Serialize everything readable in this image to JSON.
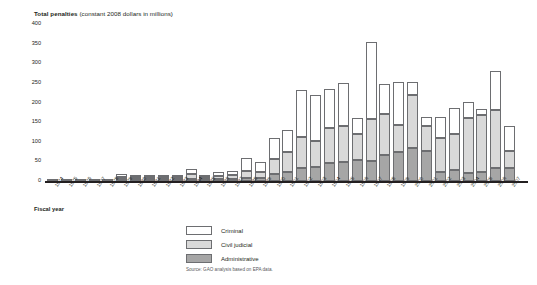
{
  "chart_data": {
    "type": "bar",
    "stacked": true,
    "title": "Total penalties (constant 2008 dollars in millions)",
    "title_bold_part": "Total penalties",
    "title_light_part": "(constant 2008 dollars in millions)",
    "xlabel": "Fiscal year",
    "ylabel": "",
    "ylim": [
      0,
      400
    ],
    "yticks": [
      0,
      50,
      100,
      150,
      200,
      250,
      300,
      350,
      400
    ],
    "ytick_labels": [
      "0",
      "50",
      "100",
      "150",
      "200",
      "250",
      "300",
      "350",
      "400"
    ],
    "grid": false,
    "legend_position": "bottom-center",
    "categories": [
      "1974",
      "1975",
      "1976",
      "1977",
      "1978",
      "1979",
      "1980",
      "1981",
      "1982",
      "1983",
      "1984",
      "1985",
      "1986",
      "1987",
      "1988",
      "1989",
      "1990",
      "1991",
      "1992",
      "1993",
      "1994",
      "1995",
      "1996",
      "1997",
      "1998",
      "1999",
      "2000",
      "2001",
      "2002",
      "2003",
      "2004",
      "2005",
      "2006",
      "2007"
    ],
    "series": [
      {
        "name": "Administrative",
        "color": "#a6a6a6",
        "values": [
          0,
          0,
          0,
          0,
          0,
          2,
          2,
          1,
          1,
          2,
          6,
          3,
          3,
          4,
          8,
          9,
          18,
          24,
          34,
          36,
          48,
          49,
          54,
          52,
          67,
          75,
          84,
          78,
          25,
          28,
          22,
          25,
          33,
          35
        ]
      },
      {
        "name": "Civil judicial",
        "color": "#d9d9d9",
        "values": [
          0,
          0,
          0,
          0,
          0,
          6,
          5,
          2,
          2,
          3,
          14,
          6,
          8,
          10,
          18,
          14,
          40,
          50,
          78,
          68,
          88,
          93,
          68,
          106,
          106,
          68,
          135,
          63,
          85,
          92,
          140,
          145,
          150,
          42
        ]
      },
      {
        "name": "Criminal",
        "color": "#ffffff",
        "values": [
          1,
          1,
          1,
          1,
          1,
          8,
          6,
          2,
          2,
          3,
          12,
          6,
          10,
          12,
          33,
          27,
          52,
          56,
          120,
          116,
          100,
          110,
          40,
          198,
          75,
          110,
          35,
          22,
          55,
          66,
          40,
          15,
          98,
          64
        ]
      }
    ],
    "totals": [
      1,
      1,
      1,
      1,
      1,
      16,
      13,
      5,
      5,
      8,
      32,
      15,
      21,
      26,
      59,
      50,
      110,
      130,
      232,
      220,
      236,
      252,
      162,
      356,
      248,
      253,
      254,
      163,
      165,
      186,
      202,
      185,
      281,
      141
    ]
  },
  "legend": {
    "items": [
      {
        "label": "Criminal",
        "swatch": "criminal"
      },
      {
        "label": "Civil judicial",
        "swatch": "civil"
      },
      {
        "label": "Administrative",
        "swatch": "admin"
      }
    ]
  },
  "source": "Source: GAO analysis based on EPA data."
}
